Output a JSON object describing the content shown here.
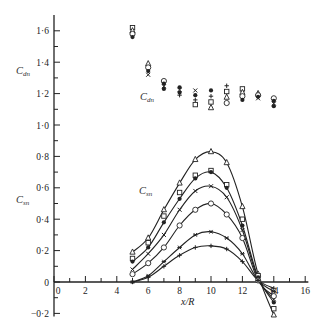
{
  "chart_data": {
    "type": "scatter",
    "title": "",
    "xlabel": "x/R",
    "ylabel_upper": "C_dn",
    "ylabel_lower": "C_sn",
    "xlim": [
      0,
      16
    ],
    "ylim": [
      -0.2,
      1.7
    ],
    "x_ticks": [
      0,
      2,
      4,
      6,
      8,
      10,
      12,
      14,
      16
    ],
    "x_tick_labels": [
      "0",
      "2",
      "4",
      "6",
      "8",
      "10",
      "12",
      "14",
      "16"
    ],
    "y_ticks": [
      -0.2,
      0,
      0.2,
      0.4,
      0.6,
      0.8,
      1.0,
      1.2,
      1.4,
      1.6
    ],
    "y_tick_labels": [
      "−0·2",
      "0",
      "0·2",
      "0·4",
      "0·6",
      "0·8",
      "1·0",
      "1·2",
      "1·4",
      "1·6"
    ],
    "grid": false,
    "annotations": [
      {
        "text": "C_dn",
        "x": 8.0,
        "y": 1.22,
        "role": "upper data group label"
      },
      {
        "text": "C_sn",
        "x": 5.8,
        "y": 0.6,
        "role": "lower curve family label"
      }
    ],
    "cdn_points": {
      "x": [
        5,
        6,
        7,
        8,
        9,
        10,
        11,
        12,
        13,
        14
      ],
      "ranges": [
        [
          1.56,
          1.62
        ],
        [
          1.32,
          1.39
        ],
        [
          1.23,
          1.28
        ],
        [
          1.19,
          1.24
        ],
        [
          1.13,
          1.22
        ],
        [
          1.11,
          1.22
        ],
        [
          1.14,
          1.25
        ],
        [
          1.16,
          1.23
        ],
        [
          1.17,
          1.2
        ],
        [
          1.12,
          1.17
        ]
      ]
    },
    "series": [
      {
        "name": "triangle",
        "marker": "triangle-open",
        "x": [
          5,
          6,
          7,
          8,
          9,
          10,
          11,
          12,
          13,
          14
        ],
        "y": [
          0.19,
          0.28,
          0.46,
          0.63,
          0.78,
          0.83,
          0.76,
          0.48,
          0.05,
          -0.21
        ]
      },
      {
        "name": "square",
        "marker": "square-open",
        "x": [
          5,
          6,
          7,
          8,
          9,
          10,
          11,
          12,
          13,
          14
        ],
        "y": [
          0.15,
          0.25,
          0.42,
          0.57,
          0.68,
          0.71,
          0.62,
          0.4,
          0.04,
          -0.17
        ]
      },
      {
        "name": "filled-circle",
        "marker": "circle-filled",
        "x": [
          5,
          6,
          7,
          8,
          9,
          10,
          11,
          12,
          13,
          14
        ],
        "y": [
          0.13,
          0.22,
          0.38,
          0.53,
          0.66,
          0.7,
          0.6,
          0.36,
          0.03,
          -0.13
        ]
      },
      {
        "name": "cross",
        "marker": "x",
        "x": [
          5,
          6,
          7,
          8,
          9,
          10,
          11,
          12,
          13,
          14
        ],
        "y": [
          0.08,
          0.18,
          0.3,
          0.46,
          0.58,
          0.61,
          0.54,
          0.33,
          0.02,
          -0.11
        ]
      },
      {
        "name": "open-circle",
        "marker": "circle-open",
        "x": [
          5,
          6,
          7,
          8,
          9,
          10,
          11,
          12,
          13,
          14
        ],
        "y": [
          0.05,
          0.12,
          0.22,
          0.36,
          0.46,
          0.5,
          0.43,
          0.28,
          0.01,
          -0.09
        ]
      },
      {
        "name": "asterisk",
        "marker": "asterisk",
        "x": [
          5,
          6,
          7,
          8,
          9,
          10,
          11,
          12,
          13,
          14
        ],
        "y": [
          0.0,
          0.04,
          0.13,
          0.22,
          0.3,
          0.32,
          0.28,
          0.18,
          0.01,
          -0.06
        ]
      },
      {
        "name": "plus",
        "marker": "plus",
        "x": [
          5,
          6,
          7,
          8,
          9,
          10,
          11,
          12,
          13,
          14
        ],
        "y": [
          0.0,
          0.03,
          0.1,
          0.17,
          0.22,
          0.23,
          0.21,
          0.13,
          0.01,
          -0.04
        ]
      }
    ]
  }
}
